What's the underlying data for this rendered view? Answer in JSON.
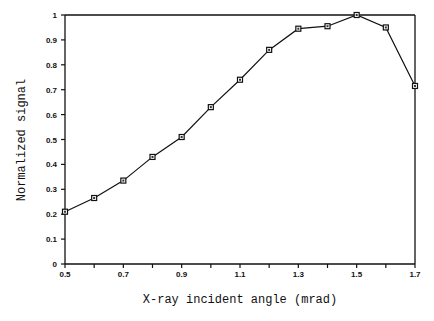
{
  "chart_data": {
    "type": "line",
    "title": "",
    "xlabel": "X-ray incident angle (mrad)",
    "ylabel": "Normalized signal",
    "xlim": [
      0.5,
      1.7
    ],
    "ylim": [
      0,
      1
    ],
    "x_ticks": [
      0.5,
      0.6,
      0.7,
      0.8,
      0.9,
      1.0,
      1.1,
      1.2,
      1.3,
      1.4,
      1.5,
      1.6,
      1.7
    ],
    "x_tick_labels": [
      "0.5",
      "",
      "0.7",
      "",
      "0.9",
      "",
      "1.1",
      "",
      "1.3",
      "",
      "1.5",
      "",
      "1.7"
    ],
    "y_ticks": [
      0,
      0.1,
      0.2,
      0.3,
      0.4,
      0.5,
      0.6,
      0.7,
      0.8,
      0.9,
      1
    ],
    "y_tick_labels": [
      "0",
      "0.1",
      "0.2",
      "0.3",
      "0.4",
      "0.5",
      "0.6",
      "0.7",
      "0.8",
      "0.9",
      "1"
    ],
    "grid": false,
    "legend": null,
    "marker": "square",
    "series": [
      {
        "name": "Normalized signal",
        "x": [
          0.5,
          0.6,
          0.7,
          0.8,
          0.9,
          1.0,
          1.1,
          1.2,
          1.3,
          1.4,
          1.5,
          1.6,
          1.7
        ],
        "values": [
          0.21,
          0.265,
          0.335,
          0.43,
          0.51,
          0.63,
          0.74,
          0.86,
          0.945,
          0.955,
          1.0,
          0.95,
          0.715
        ]
      }
    ]
  }
}
